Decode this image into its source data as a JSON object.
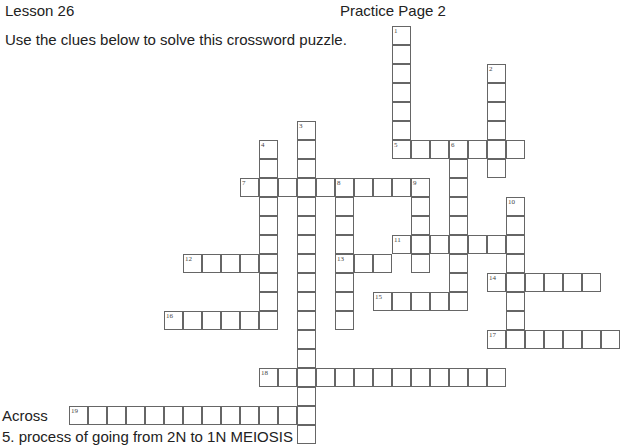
{
  "header": {
    "lesson": "Lesson 26",
    "page_title": "Practice Page 2",
    "instructions": "Use the clues below to solve this crossword puzzle."
  },
  "clues": {
    "across_heading": "Across",
    "across": [
      {
        "number": 5,
        "text": "5. process of going from 2N to 1N   MEIOSIS"
      }
    ]
  },
  "puzzle": {
    "grid": {
      "origin_x": 69,
      "origin_y": 26,
      "cell_size": 19
    },
    "words": [
      {
        "number": 1,
        "dir": "down",
        "col": 17,
        "row": 0,
        "length": 7
      },
      {
        "number": 2,
        "dir": "down",
        "col": 22,
        "row": 2,
        "length": 6
      },
      {
        "number": 3,
        "dir": "down",
        "col": 12,
        "row": 5,
        "length": 17
      },
      {
        "number": 4,
        "dir": "down",
        "col": 10,
        "row": 6,
        "length": 10
      },
      {
        "number": 5,
        "dir": "across",
        "col": 17,
        "row": 6,
        "length": 7
      },
      {
        "number": 6,
        "dir": "down",
        "col": 20,
        "row": 6,
        "length": 9
      },
      {
        "number": 7,
        "dir": "across",
        "col": 9,
        "row": 8,
        "length": 10
      },
      {
        "number": 8,
        "dir": "down",
        "col": 14,
        "row": 8,
        "length": 8
      },
      {
        "number": 9,
        "dir": "down",
        "col": 18,
        "row": 8,
        "length": 5
      },
      {
        "number": 10,
        "dir": "down",
        "col": 23,
        "row": 9,
        "length": 8
      },
      {
        "number": 11,
        "dir": "across",
        "col": 17,
        "row": 11,
        "length": 7
      },
      {
        "number": 12,
        "dir": "across",
        "col": 6,
        "row": 12,
        "length": 5
      },
      {
        "number": 13,
        "dir": "across",
        "col": 14,
        "row": 12,
        "length": 3
      },
      {
        "number": 14,
        "dir": "across",
        "col": 22,
        "row": 13,
        "length": 6
      },
      {
        "number": 15,
        "dir": "across",
        "col": 16,
        "row": 14,
        "length": 5
      },
      {
        "number": 16,
        "dir": "across",
        "col": 5,
        "row": 15,
        "length": 6
      },
      {
        "number": 17,
        "dir": "across",
        "col": 22,
        "row": 16,
        "length": 7
      },
      {
        "number": 18,
        "dir": "across",
        "col": 10,
        "row": 18,
        "length": 13
      },
      {
        "number": 19,
        "dir": "across",
        "col": 0,
        "row": 20,
        "length": 13
      }
    ]
  }
}
